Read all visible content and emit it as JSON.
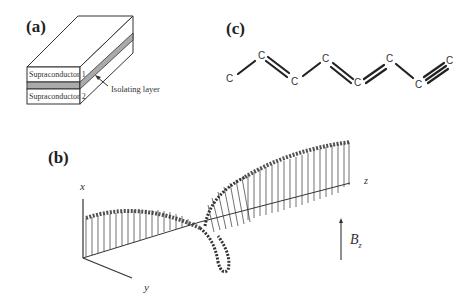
{
  "panels": {
    "a": {
      "label": "(a)",
      "layer_top": "Supraconductor 1",
      "layer_bottom": "Supraconductor 2",
      "annotation": "Isolating layer"
    },
    "b": {
      "label": "(b)",
      "axis_x": "x",
      "axis_y": "y",
      "axis_z": "z",
      "field_label": "B",
      "field_subscript": "z"
    },
    "c": {
      "label": "(c)",
      "atoms": [
        "C",
        "C",
        "C",
        "C",
        "C",
        "C",
        "C",
        "C"
      ],
      "bonds": [
        "single",
        "double",
        "single",
        "double",
        "double",
        "single",
        "triple"
      ]
    }
  }
}
